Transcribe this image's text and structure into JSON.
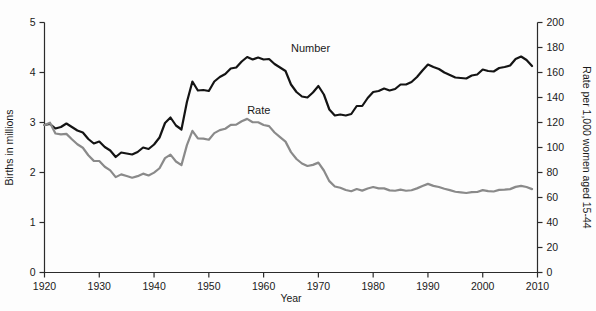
{
  "chart_data": {
    "type": "line",
    "title": "",
    "xlabel": "Year",
    "ylabel": "Births in millions",
    "y2label": "Rate per 1,000 women aged 15-44",
    "xlim": [
      1920,
      2010
    ],
    "ylim": [
      0,
      5
    ],
    "y2lim": [
      0,
      200
    ],
    "xticks": [
      1920,
      1930,
      1940,
      1950,
      1960,
      1970,
      1980,
      1990,
      2000,
      2010
    ],
    "xtick_labels": [
      "1920",
      "1930",
      "1940",
      "1950",
      "1960",
      "1970",
      "1980",
      "1990",
      "2000",
      "2010"
    ],
    "yticks": [
      0,
      1,
      2,
      3,
      4,
      5
    ],
    "ytick_labels": [
      "0",
      "1",
      "2",
      "3",
      "4",
      "5"
    ],
    "y2ticks": [
      0,
      20,
      40,
      60,
      80,
      100,
      120,
      140,
      160,
      180,
      200
    ],
    "y2tick_labels": [
      "0",
      "20",
      "40",
      "60",
      "80",
      "100",
      "120",
      "140",
      "160",
      "180",
      "200"
    ],
    "grid": false,
    "legend_position": "inline-annotations",
    "annotations": [
      {
        "text": "Number",
        "x": 1965,
        "y": 4.42,
        "color": "#1a1a1a"
      },
      {
        "text": "Rate",
        "x": 1957,
        "y": 3.18,
        "color": "#1a1a1a"
      }
    ],
    "series": [
      {
        "name": "Number",
        "axis": "left",
        "unit": "millions of births",
        "color": "#141414",
        "width": 2.2,
        "x": [
          1920,
          1921,
          1922,
          1923,
          1924,
          1925,
          1926,
          1927,
          1928,
          1929,
          1930,
          1931,
          1932,
          1933,
          1934,
          1935,
          1936,
          1937,
          1938,
          1939,
          1940,
          1941,
          1942,
          1943,
          1944,
          1945,
          1946,
          1947,
          1948,
          1949,
          1950,
          1951,
          1952,
          1953,
          1954,
          1955,
          1956,
          1957,
          1958,
          1959,
          1960,
          1961,
          1962,
          1963,
          1964,
          1965,
          1966,
          1967,
          1968,
          1969,
          1970,
          1971,
          1972,
          1973,
          1974,
          1975,
          1976,
          1977,
          1978,
          1979,
          1980,
          1981,
          1982,
          1983,
          1984,
          1985,
          1986,
          1987,
          1988,
          1989,
          1990,
          1991,
          1992,
          1993,
          1994,
          1995,
          1996,
          1997,
          1998,
          1999,
          2000,
          2001,
          2002,
          2003,
          2004,
          2005,
          2006,
          2007,
          2008,
          2009
        ],
        "values": [
          2.95,
          2.97,
          2.88,
          2.91,
          2.98,
          2.91,
          2.84,
          2.8,
          2.67,
          2.58,
          2.62,
          2.51,
          2.44,
          2.31,
          2.4,
          2.38,
          2.36,
          2.41,
          2.5,
          2.47,
          2.56,
          2.7,
          2.99,
          3.1,
          2.94,
          2.86,
          3.41,
          3.82,
          3.64,
          3.65,
          3.63,
          3.82,
          3.91,
          3.97,
          4.08,
          4.1,
          4.22,
          4.31,
          4.26,
          4.3,
          4.26,
          4.27,
          4.17,
          4.1,
          4.03,
          3.76,
          3.61,
          3.52,
          3.5,
          3.6,
          3.73,
          3.56,
          3.26,
          3.14,
          3.16,
          3.14,
          3.17,
          3.33,
          3.33,
          3.49,
          3.61,
          3.63,
          3.68,
          3.64,
          3.67,
          3.76,
          3.76,
          3.81,
          3.91,
          4.04,
          4.16,
          4.11,
          4.07,
          4.0,
          3.95,
          3.9,
          3.89,
          3.88,
          3.94,
          3.96,
          4.06,
          4.03,
          4.02,
          4.09,
          4.11,
          4.14,
          4.27,
          4.32,
          4.25,
          4.13
        ]
      },
      {
        "name": "Rate",
        "axis": "right",
        "unit": "births per 1,000 women aged 15-44",
        "color": "#8a8a8a",
        "width": 2.2,
        "x": [
          1920,
          1921,
          1922,
          1923,
          1924,
          1925,
          1926,
          1927,
          1928,
          1929,
          1930,
          1931,
          1932,
          1933,
          1934,
          1935,
          1936,
          1937,
          1938,
          1939,
          1940,
          1941,
          1942,
          1943,
          1944,
          1945,
          1946,
          1947,
          1948,
          1949,
          1950,
          1951,
          1952,
          1953,
          1954,
          1955,
          1956,
          1957,
          1958,
          1959,
          1960,
          1961,
          1962,
          1963,
          1964,
          1965,
          1966,
          1967,
          1968,
          1969,
          1970,
          1971,
          1972,
          1973,
          1974,
          1975,
          1976,
          1977,
          1978,
          1979,
          1980,
          1981,
          1982,
          1983,
          1984,
          1985,
          1986,
          1987,
          1988,
          1989,
          1990,
          1991,
          1992,
          1993,
          1994,
          1995,
          1996,
          1997,
          1998,
          1999,
          2000,
          2001,
          2002,
          2003,
          2004,
          2005,
          2006,
          2007,
          2008,
          2009
        ],
        "values": [
          117.9,
          119.8,
          111.2,
          110.5,
          110.9,
          106.6,
          102.6,
          99.8,
          93.8,
          89.3,
          89.2,
          84.6,
          81.7,
          76.3,
          78.5,
          77.2,
          75.8,
          77.1,
          79.1,
          77.6,
          79.9,
          83.4,
          91.5,
          94.3,
          88.8,
          85.9,
          101.9,
          113.3,
          107.3,
          107.1,
          106.2,
          111.5,
          113.9,
          115.0,
          118.1,
          118.3,
          121.0,
          122.9,
          120.2,
          120.2,
          118.0,
          117.1,
          112.0,
          108.3,
          104.7,
          96.3,
          90.8,
          87.2,
          85.2,
          86.1,
          87.9,
          81.6,
          73.1,
          68.8,
          67.8,
          66.0,
          65.0,
          66.8,
          65.5,
          67.2,
          68.4,
          67.3,
          67.3,
          65.7,
          65.4,
          66.3,
          65.4,
          65.8,
          67.3,
          69.2,
          70.9,
          69.3,
          68.4,
          67.0,
          65.9,
          64.6,
          64.1,
          63.6,
          64.3,
          64.4,
          65.9,
          65.1,
          64.8,
          66.1,
          66.3,
          66.7,
          68.5,
          69.3,
          68.4,
          66.7
        ]
      }
    ]
  }
}
